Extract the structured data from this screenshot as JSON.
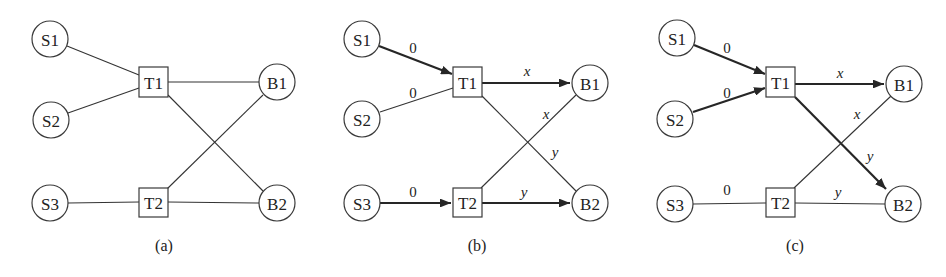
{
  "panels": [
    {
      "id": "a",
      "caption": "(a)",
      "nodes": {
        "S1": {
          "label": "S1",
          "shape": "circle"
        },
        "S2": {
          "label": "S2",
          "shape": "circle"
        },
        "S3": {
          "label": "S3",
          "shape": "circle"
        },
        "T1": {
          "label": "T1",
          "shape": "box"
        },
        "T2": {
          "label": "T2",
          "shape": "box"
        },
        "B1": {
          "label": "B1",
          "shape": "circle"
        },
        "B2": {
          "label": "B2",
          "shape": "circle"
        }
      },
      "edges": [
        {
          "from": "S1",
          "to": "T1",
          "label": "",
          "directed": false
        },
        {
          "from": "S2",
          "to": "T1",
          "label": "",
          "directed": false
        },
        {
          "from": "S3",
          "to": "T2",
          "label": "",
          "directed": false
        },
        {
          "from": "T1",
          "to": "B1",
          "label": "",
          "directed": false
        },
        {
          "from": "T1",
          "to": "B2",
          "label": "",
          "directed": false
        },
        {
          "from": "T2",
          "to": "B1",
          "label": "",
          "directed": false
        },
        {
          "from": "T2",
          "to": "B2",
          "label": "",
          "directed": false
        }
      ]
    },
    {
      "id": "b",
      "caption": "(b)",
      "nodes": {
        "S1": {
          "label": "S1",
          "shape": "circle"
        },
        "S2": {
          "label": "S2",
          "shape": "circle"
        },
        "S3": {
          "label": "S3",
          "shape": "circle"
        },
        "T1": {
          "label": "T1",
          "shape": "box"
        },
        "T2": {
          "label": "T2",
          "shape": "box"
        },
        "B1": {
          "label": "B1",
          "shape": "circle"
        },
        "B2": {
          "label": "B2",
          "shape": "circle"
        }
      },
      "edges": [
        {
          "from": "S1",
          "to": "T1",
          "label": "0",
          "directed": true
        },
        {
          "from": "S2",
          "to": "T1",
          "label": "0",
          "directed": false
        },
        {
          "from": "S3",
          "to": "T2",
          "label": "0",
          "directed": true
        },
        {
          "from": "T1",
          "to": "B1",
          "label": "x",
          "directed": true
        },
        {
          "from": "T1",
          "to": "B2",
          "label": "y",
          "directed": false
        },
        {
          "from": "T2",
          "to": "B1",
          "label": "x",
          "directed": false
        },
        {
          "from": "T2",
          "to": "B2",
          "label": "y",
          "directed": true
        }
      ]
    },
    {
      "id": "c",
      "caption": "(c)",
      "nodes": {
        "S1": {
          "label": "S1",
          "shape": "circle"
        },
        "S2": {
          "label": "S2",
          "shape": "circle"
        },
        "S3": {
          "label": "S3",
          "shape": "circle"
        },
        "T1": {
          "label": "T1",
          "shape": "box"
        },
        "T2": {
          "label": "T2",
          "shape": "box"
        },
        "B1": {
          "label": "B1",
          "shape": "circle"
        },
        "B2": {
          "label": "B2",
          "shape": "circle"
        }
      },
      "edges": [
        {
          "from": "S1",
          "to": "T1",
          "label": "0",
          "directed": true
        },
        {
          "from": "S2",
          "to": "T1",
          "label": "0",
          "directed": true
        },
        {
          "from": "S3",
          "to": "T2",
          "label": "0",
          "directed": false
        },
        {
          "from": "T1",
          "to": "B1",
          "label": "x",
          "directed": true
        },
        {
          "from": "T1",
          "to": "B2",
          "label": "y",
          "directed": true
        },
        {
          "from": "T2",
          "to": "B1",
          "label": "x",
          "directed": false
        },
        {
          "from": "T2",
          "to": "B2",
          "label": "y",
          "directed": false
        }
      ]
    }
  ],
  "colors": {
    "stroke": "#333333",
    "fill": "#ffffff",
    "text": "#222222"
  }
}
